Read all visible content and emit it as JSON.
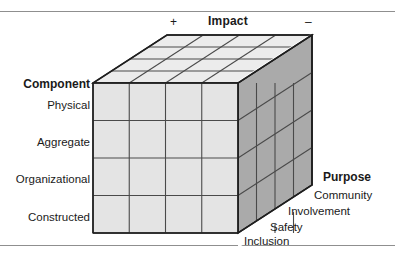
{
  "figure": {
    "rules": {
      "top": "horizontal-rule",
      "bottom": "horizontal-rule"
    }
  },
  "axes": {
    "impact": {
      "label": "Impact",
      "positive_sign": "+",
      "negative_sign": "–",
      "orientation": "horizontal-top",
      "divisions": 4
    },
    "component": {
      "label": "Component",
      "orientation": "vertical-left",
      "categories": [
        "Physical",
        "Aggregate",
        "Organizational",
        "Constructed"
      ]
    },
    "purpose": {
      "label": "Purpose",
      "orientation": "depth-right",
      "categories": [
        "Community",
        "Involvement",
        "Safety",
        "Inclusion"
      ]
    }
  },
  "cube": {
    "rows": 4,
    "columns": 4,
    "depth": 4,
    "colors": {
      "front_face": "#e4e4e4",
      "top_face": "#ececec",
      "side_face": "#aaaaaa",
      "grid_line": "#4a4a4a",
      "outline": "#1f1f1f",
      "background": "#ffffff",
      "rule": "#8f8f8f",
      "text": "#1a1a1a"
    },
    "geometry": {
      "front_left_x": 93,
      "front_right_x": 238,
      "front_top_y": 83,
      "front_bottom_y": 233,
      "depth_dx": 74,
      "depth_dy": -48
    }
  }
}
